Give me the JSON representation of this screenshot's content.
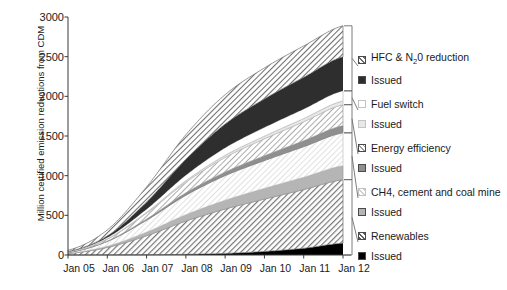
{
  "axes": {
    "ylabel": "Million certified emission reductions from CDM",
    "yticks": [
      "0",
      "500",
      "1000",
      "1500",
      "2000",
      "2500",
      "3000"
    ],
    "ylim": [
      0,
      3000
    ],
    "xticks": [
      "Jan 05",
      "Jan 06",
      "Jan 07",
      "Jan 08",
      "Jan 09",
      "Jan 10",
      "Jan 11",
      "Jan 12"
    ]
  },
  "legend": {
    "groups": [
      {
        "name": "HFC & N20 reduction",
        "label_html": "HFC &amp; N<sub>2</sub>0 reduction",
        "label": "HFC & N20 reduction",
        "issued_label": "Issued",
        "color": "#cfcfcf",
        "issued_color": "#2e2e2e"
      },
      {
        "name": "Fuel switch",
        "label_html": "Fuel switch",
        "label": "Fuel switch",
        "issued_label": "Issued",
        "color": "#ffffff",
        "issued_color": "#e8e8e8"
      },
      {
        "name": "Energy efficiency",
        "label_html": "Energy efficiency",
        "label": "Energy efficiency",
        "issued_label": "Issued",
        "color": "#dcdcdc",
        "issued_color": "#9a9a9a"
      },
      {
        "name": "CH4, cement and coal mine",
        "label_html": "CH4, cement and coal mine",
        "label": "CH4, cement and coal mine",
        "issued_label": "Issued",
        "color": "#efefef",
        "issued_color": "#bdbdbd"
      },
      {
        "name": "Renewables",
        "label_html": "Renewables",
        "label": "Renewables",
        "issued_label": "Issued",
        "color": "#9e9e9e",
        "issued_color": "#000000"
      }
    ]
  },
  "chart_data": {
    "type": "area",
    "title": "",
    "xlabel": "",
    "ylabel": "Million certified emission reductions from CDM",
    "xlim": [
      "Jan 05",
      "Jan 12"
    ],
    "ylim": [
      0,
      3000
    ],
    "grid": false,
    "legend_position": "right",
    "stacked": true,
    "x": [
      "Jan 05",
      "Jan 06",
      "Jan 07",
      "Jan 08",
      "Jan 09",
      "Jan 10",
      "Jan 11",
      "Jan 12"
    ],
    "series": [
      {
        "name": "Renewables Issued",
        "values": [
          0,
          1,
          3,
          8,
          20,
          45,
          85,
          150
        ]
      },
      {
        "name": "Renewables",
        "values": [
          20,
          95,
          240,
          420,
          560,
          660,
          740,
          800
        ]
      },
      {
        "name": "CH4, cement and coal mine Issued",
        "values": [
          2,
          15,
          45,
          80,
          110,
          135,
          155,
          175
        ]
      },
      {
        "name": "CH4, cement and coal mine",
        "values": [
          10,
          60,
          150,
          245,
          310,
          350,
          385,
          415
        ]
      },
      {
        "name": "Energy efficiency Issued",
        "values": [
          1,
          5,
          15,
          30,
          45,
          60,
          75,
          90
        ]
      },
      {
        "name": "Energy efficiency",
        "values": [
          5,
          25,
          75,
          135,
          185,
          215,
          240,
          265
        ]
      },
      {
        "name": "Fuel switch Issued",
        "values": [
          1,
          4,
          10,
          18,
          26,
          33,
          40,
          46
        ]
      },
      {
        "name": "Fuel switch",
        "values": [
          3,
          16,
          40,
          70,
          95,
          110,
          120,
          128
        ]
      },
      {
        "name": "HFC & N20 reduction Issued",
        "values": [
          2,
          20,
          90,
          200,
          300,
          360,
          400,
          430
        ]
      },
      {
        "name": "HFC & N20 reduction",
        "values": [
          16,
          75,
          190,
          310,
          370,
          390,
          395,
          390
        ]
      }
    ],
    "totals": [
      60,
      316,
      858,
      1516,
      2021,
      2358,
      2635,
      2889
    ]
  }
}
